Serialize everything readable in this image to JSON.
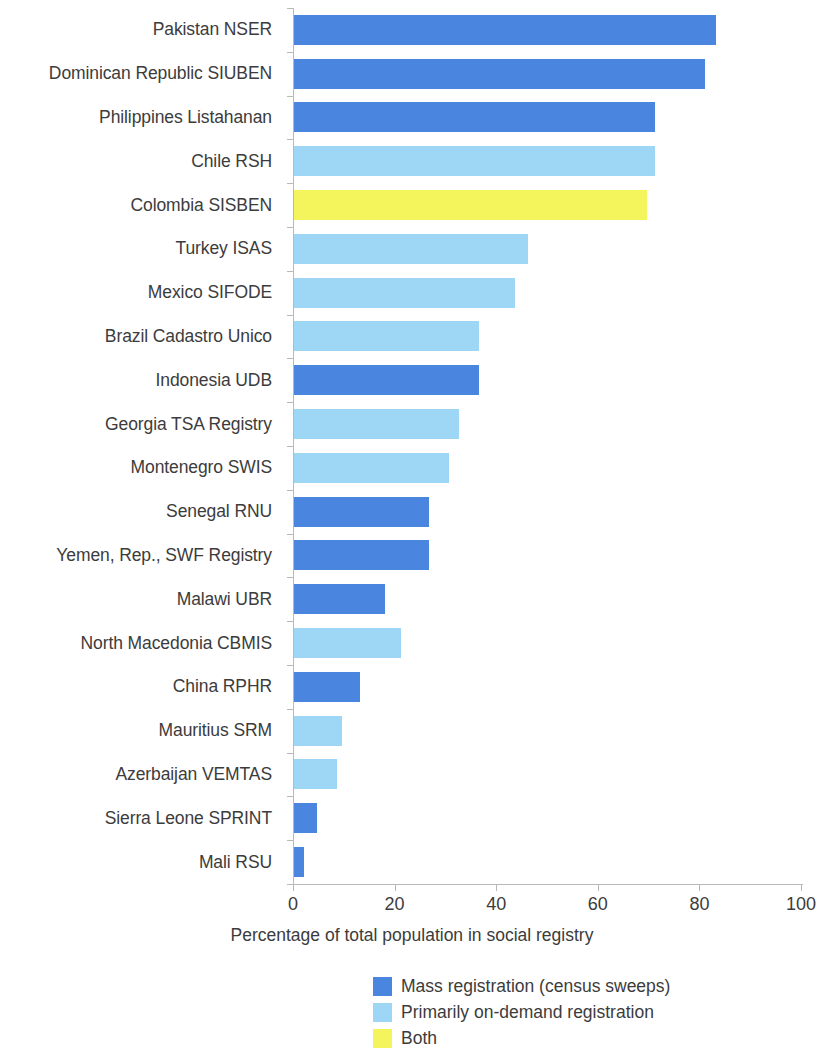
{
  "chart_data": {
    "type": "bar",
    "orientation": "horizontal",
    "title": "",
    "xlabel": "Percentage of total population in social registry",
    "ylabel": "",
    "xlim": [
      0,
      100
    ],
    "xticks": [
      0,
      20,
      40,
      60,
      80,
      100
    ],
    "grid": false,
    "legend_position": "bottom-center",
    "categories": [
      "Pakistan NSER",
      "Dominican Republic SIUBEN",
      "Philippines Listahanan",
      "Chile RSH",
      "Colombia SISBEN",
      "Turkey ISAS",
      "Mexico SIFODE",
      "Brazil Cadastro Unico",
      "Indonesia UDB",
      "Georgia TSA Registry",
      "Montenegro SWIS",
      "Senegal RNU",
      "Yemen, Rep., SWF Registry",
      "Malawi UBR",
      "North Macedonia CBMIS",
      "China RPHR",
      "Mauritius SRM",
      "Azerbaijan VEMTAS",
      "Sierra Leone SPRINT",
      "Mali RSU"
    ],
    "values": [
      83,
      81,
      71,
      71,
      69.5,
      46,
      43.5,
      36.5,
      36.5,
      32.5,
      30.5,
      26.5,
      26.5,
      18,
      21,
      13,
      9.5,
      8.5,
      4.5,
      2
    ],
    "value_categories": [
      "mass",
      "mass",
      "mass",
      "ondemand",
      "both",
      "ondemand",
      "ondemand",
      "ondemand",
      "mass",
      "ondemand",
      "ondemand",
      "mass",
      "mass",
      "mass",
      "ondemand",
      "mass",
      "ondemand",
      "ondemand",
      "mass",
      "mass"
    ],
    "colors": {
      "mass": "#4a86e0",
      "ondemand": "#9ed7f5",
      "both": "#f4f45c"
    },
    "legend": [
      {
        "key": "mass",
        "label": "Mass registration (census sweeps)",
        "color": "#4a86e0"
      },
      {
        "key": "ondemand",
        "label": "Primarily on-demand registration",
        "color": "#9ed7f5"
      },
      {
        "key": "both",
        "label": "Both",
        "color": "#f4f45c"
      }
    ]
  }
}
